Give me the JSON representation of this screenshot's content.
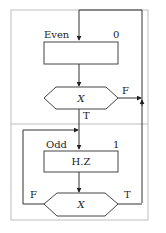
{
  "diagram": {
    "type": "structogram-flowchart",
    "upper_block": {
      "state_name": "Even",
      "state_output": "0",
      "action_text": "",
      "condition": "X",
      "true_label": "T",
      "false_label": "F"
    },
    "lower_block": {
      "state_name": "Odd",
      "state_output": "1",
      "action_text": "H.Z",
      "condition": "X",
      "true_label": "T",
      "false_label": "F"
    },
    "edges": [
      {
        "from": "upper_condition",
        "label": "F",
        "to": "upper_state_entry"
      },
      {
        "from": "upper_condition",
        "label": "T",
        "to": "lower_state_entry"
      },
      {
        "from": "lower_condition",
        "label": "F",
        "to": "lower_state_entry"
      },
      {
        "from": "lower_condition",
        "label": "T",
        "to": "upper_state_entry"
      }
    ]
  }
}
